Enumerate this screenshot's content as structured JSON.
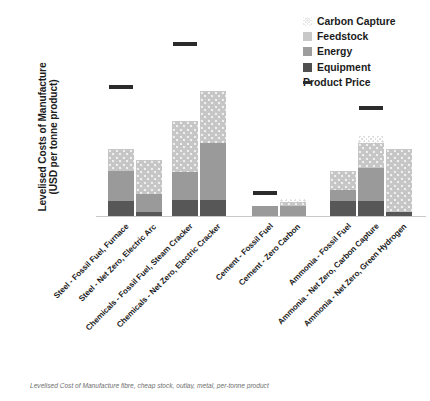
{
  "chart_data": {
    "type": "bar",
    "stacked": true,
    "title": "",
    "xlabel": "",
    "ylabel": "Levelised Costs of Manufacture (USD per tonne product)",
    "ylabel_lines": [
      "Levelised Costs of Manufacture",
      "(USD per tonne product)"
    ],
    "ylim": [
      0,
      900
    ],
    "yticks": [
      0,
      100,
      200,
      300,
      400,
      500,
      600,
      700,
      800,
      900
    ],
    "grid": false,
    "legend_position": "top-right",
    "categories": [
      "Steel - Fossil Fuel, Furnace",
      "Steel - Net Zero, Electric Arc",
      "Chemicals - Fossil Fuel, Steam Cracker",
      "Chemicals - Net Zero, Electric Cracker",
      "Cement - Fossil Fuel",
      "Cement - Zero Carbon",
      "Ammonia - Fossil Fuel",
      "Ammonia - Net Zero, Carbon Capture",
      "Ammonia - Net Zero, Green Hydrogen"
    ],
    "groups": [
      "Steel",
      "Steel",
      "Chemicals",
      "Chemicals",
      "Cement",
      "Cement",
      "Ammonia",
      "Ammonia",
      "Ammonia"
    ],
    "series": [
      {
        "name": "Equipment",
        "values": [
          68,
          18,
          75,
          75,
          0,
          0,
          70,
          70,
          20
        ]
      },
      {
        "name": "Energy",
        "values": [
          139,
          82,
          127,
          265,
          45,
          45,
          52,
          155,
          0
        ]
      },
      {
        "name": "Feedstock",
        "values": [
          103,
          160,
          238,
          240,
          0,
          18,
          88,
          115,
          290
        ]
      },
      {
        "name": "Carbon Capture",
        "values": [
          0,
          0,
          0,
          0,
          0,
          0,
          0,
          0,
          0
        ]
      }
    ],
    "carbon_capture_values": [
      0,
      0,
      0,
      0,
      0,
      18,
      0,
      0,
      0
    ],
    "bar_totals": [
      310,
      260,
      440,
      580,
      45,
      63,
      210,
      340,
      310
    ],
    "product_price": {
      "name": "Product Price",
      "Steel": 600,
      "Chemicals": 800,
      "Cement": 105,
      "Ammonia": 500
    },
    "legend": [
      {
        "label": "Carbon Capture",
        "swatch": "capture"
      },
      {
        "label": "Feedstock",
        "swatch": "feedstock"
      },
      {
        "label": "Energy",
        "swatch": "energy"
      },
      {
        "label": "Equipment",
        "swatch": "equipment"
      },
      {
        "label": "Product Price",
        "swatch": "price"
      }
    ],
    "colors": {
      "equipment": "#575757",
      "energy": "#9a9a9a",
      "feedstock": "#c6c6c6",
      "carbon_capture": "#dedede",
      "product_price": "#2b2b2b",
      "axis": "#c9c9c9",
      "text": "#1b1b1b"
    }
  },
  "caption": "Levelised Cost of Manufacture fibre, cheap stock, outlay, metal, per-tonne product"
}
